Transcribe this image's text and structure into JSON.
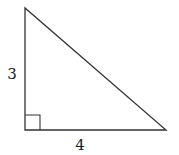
{
  "diagram": {
    "type": "right-triangle",
    "vertices": {
      "top": [
        25,
        8
      ],
      "right_angle": [
        25,
        130
      ],
      "right": [
        166,
        130
      ]
    },
    "right_angle_marker_size": 15,
    "labels": {
      "vertical_leg": "3",
      "horizontal_leg": "4"
    },
    "colors": {
      "stroke": "#333333",
      "text": "#1a1a1a",
      "background": "#ffffff"
    }
  }
}
